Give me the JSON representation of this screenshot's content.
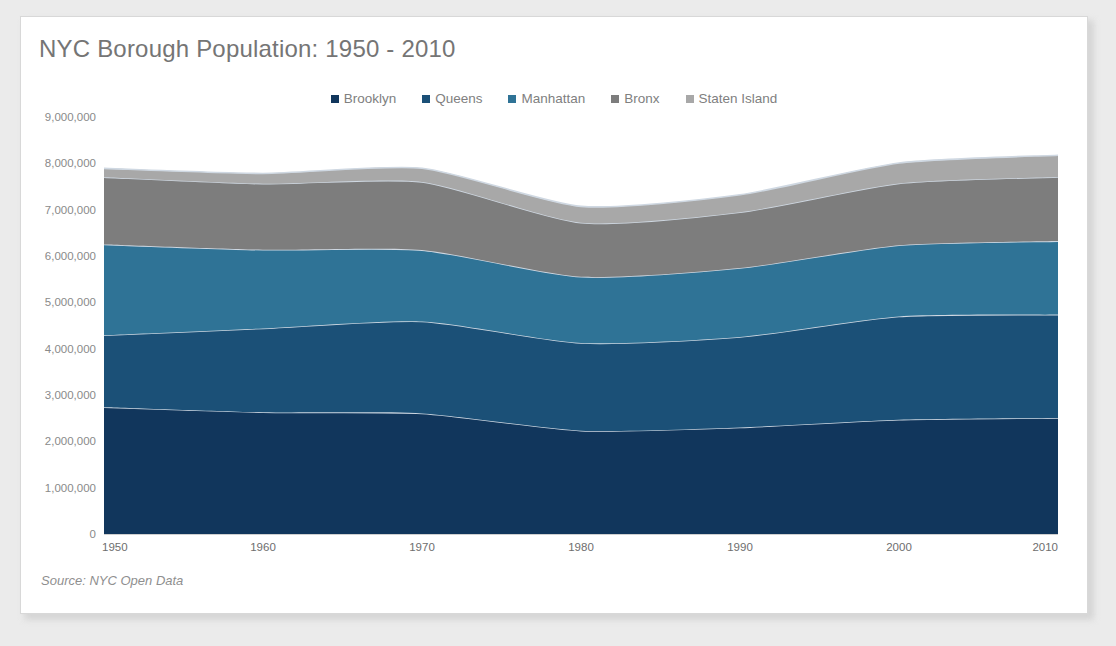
{
  "card": {
    "title": "NYC Borough Population: 1950 - 2010",
    "source_note": "Source: NYC Open Data"
  },
  "colors": {
    "brooklyn": "#11365c",
    "queens": "#1b5077",
    "manhattan": "#2f7396",
    "bronx": "#7d7d7d",
    "staten_island": "#a8a8a8",
    "title": "#757575",
    "axis_text": "#8a8a8a",
    "card_background": "#ffffff",
    "page_background": "#ebebeb",
    "separator": "#cfd8e2"
  },
  "legend": {
    "position": "top-center",
    "items": [
      {
        "label": "Brooklyn",
        "color": "#11365c"
      },
      {
        "label": "Queens",
        "color": "#1b5077"
      },
      {
        "label": "Manhattan",
        "color": "#2f7396"
      },
      {
        "label": "Bronx",
        "color": "#7d7d7d"
      },
      {
        "label": "Staten Island",
        "color": "#a8a8a8"
      }
    ]
  },
  "chart_data": {
    "type": "area",
    "stacked": true,
    "title": "NYC Borough Population: 1950 - 2010",
    "xlabel": "",
    "ylabel": "",
    "grid": false,
    "legend_position": "top-center",
    "x": [
      1950,
      1960,
      1970,
      1980,
      1990,
      2000,
      2010
    ],
    "categories": [
      "1950",
      "1960",
      "1970",
      "1980",
      "1990",
      "2000",
      "2010"
    ],
    "xlim": [
      1950,
      2010
    ],
    "ylim": [
      0,
      9000000
    ],
    "ytick_labels": [
      "0",
      "1,000,000",
      "2,000,000",
      "3,000,000",
      "4,000,000",
      "5,000,000",
      "6,000,000",
      "7,000,000",
      "8,000,000",
      "9,000,000"
    ],
    "yticks": [
      0,
      1000000,
      2000000,
      3000000,
      4000000,
      5000000,
      6000000,
      7000000,
      8000000,
      9000000
    ],
    "xtick_labels": [
      "1950",
      "1960",
      "1970",
      "1980",
      "1990",
      "2000",
      "2010"
    ],
    "series": [
      {
        "name": "Brooklyn",
        "color": "#11365c",
        "values": [
          2738175,
          2627319,
          2602012,
          2230936,
          2300664,
          2465326,
          2504700
        ]
      },
      {
        "name": "Queens",
        "color": "#1b5077",
        "values": [
          1550849,
          1809578,
          1986473,
          1891325,
          1951598,
          2229379,
          2230722
        ]
      },
      {
        "name": "Manhattan",
        "color": "#2f7396",
        "values": [
          1960101,
          1698281,
          1539233,
          1428285,
          1487536,
          1537195,
          1585873
        ]
      },
      {
        "name": "Bronx",
        "color": "#7d7d7d",
        "values": [
          1451277,
          1424815,
          1471701,
          1168972,
          1203789,
          1332650,
          1385108
        ]
      },
      {
        "name": "Staten Island",
        "color": "#a8a8a8",
        "values": [
          191555,
          221991,
          295443,
          352121,
          378977,
          443728,
          468730
        ]
      }
    ],
    "totals": [
      7891957,
      7781984,
      7894862,
      7071639,
      7322564,
      8008278,
      8175133
    ]
  }
}
